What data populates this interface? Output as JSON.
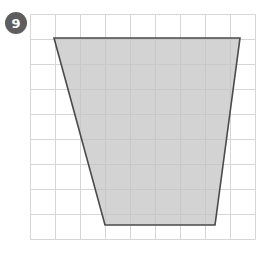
{
  "canvas": {
    "width": 267,
    "height": 259,
    "background": "#ffffff"
  },
  "badge": {
    "label": "9",
    "shape": "circle",
    "fill": "#5e5e5e",
    "text_color": "#ffffff",
    "center_x": 16,
    "center_y": 23,
    "diameter": 22
  },
  "grid": {
    "origin_x": 30,
    "origin_y": 14,
    "cell_size": 25,
    "cols": 9,
    "rows": 9,
    "line_color": "#d6d6d6",
    "line_width": 1,
    "width": 225,
    "height": 225
  },
  "figure": {
    "name": "trapezoid",
    "sides": 4,
    "fill": "#c2c2c2",
    "fill_opacity": 0.72,
    "stroke": "#4a4a4a",
    "stroke_width": 1.6,
    "points": "54,38 240,38 215,225 105,225",
    "vertices": [
      {
        "name": "top-left",
        "x": 54,
        "y": 38
      },
      {
        "name": "top-right",
        "x": 240,
        "y": 38
      },
      {
        "name": "bottom-right",
        "x": 215,
        "y": 225
      },
      {
        "name": "bottom-left",
        "x": 105,
        "y": 225
      }
    ],
    "grid_units": {
      "top_width": 7.44,
      "bottom_width": 4.4,
      "height": 7.48
    }
  }
}
